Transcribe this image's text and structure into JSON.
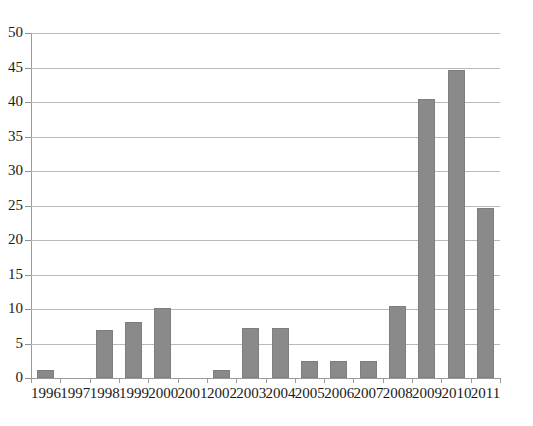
{
  "chart_data": {
    "type": "bar",
    "title": "",
    "subtitle": "",
    "xlabel": "",
    "ylabel": "",
    "categories": [
      "1996",
      "1997",
      "1998",
      "1999",
      "2000",
      "2001",
      "2002",
      "2003",
      "2004",
      "2005",
      "2006",
      "2007",
      "2008",
      "2009",
      "2010",
      "2011"
    ],
    "values": [
      1.2,
      0,
      7.0,
      8.1,
      10.1,
      0,
      1.2,
      7.2,
      7.3,
      2.4,
      2.4,
      2.4,
      10.5,
      40.5,
      44.6,
      24.7
    ],
    "ylim": [
      0,
      50
    ],
    "yticks": [
      0,
      5,
      10,
      15,
      20,
      25,
      30,
      35,
      40,
      45,
      50
    ],
    "ytick_labels": [
      "0",
      "5",
      "10",
      "15",
      "20",
      "25",
      "30",
      "35",
      "40",
      "45",
      "50"
    ],
    "grid": true,
    "grid_axis": "y",
    "legend": false,
    "legend_position": "none",
    "bar_color": "#8a8a8a",
    "gridline_color": "#b9b9b9",
    "axis_color": "#9a9a9a",
    "background_color": "#ffffff"
  }
}
